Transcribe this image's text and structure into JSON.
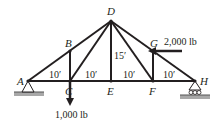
{
  "diagram": {
    "type": "truss",
    "joints": {
      "A": "A",
      "B": "B",
      "C": "C",
      "D": "D",
      "E": "E",
      "F": "F",
      "G": "G",
      "H": "H"
    },
    "dimensions": {
      "AC": "10′",
      "CE": "10′",
      "EF": "10′",
      "FH": "10′",
      "DE": "15′"
    },
    "loads": {
      "C": "1,000 lb",
      "G": "2,000 lb"
    },
    "supports": {
      "A": "pin",
      "H": "roller"
    },
    "colors": {
      "member": "#231f20",
      "ground": "#9d9d9d"
    }
  }
}
